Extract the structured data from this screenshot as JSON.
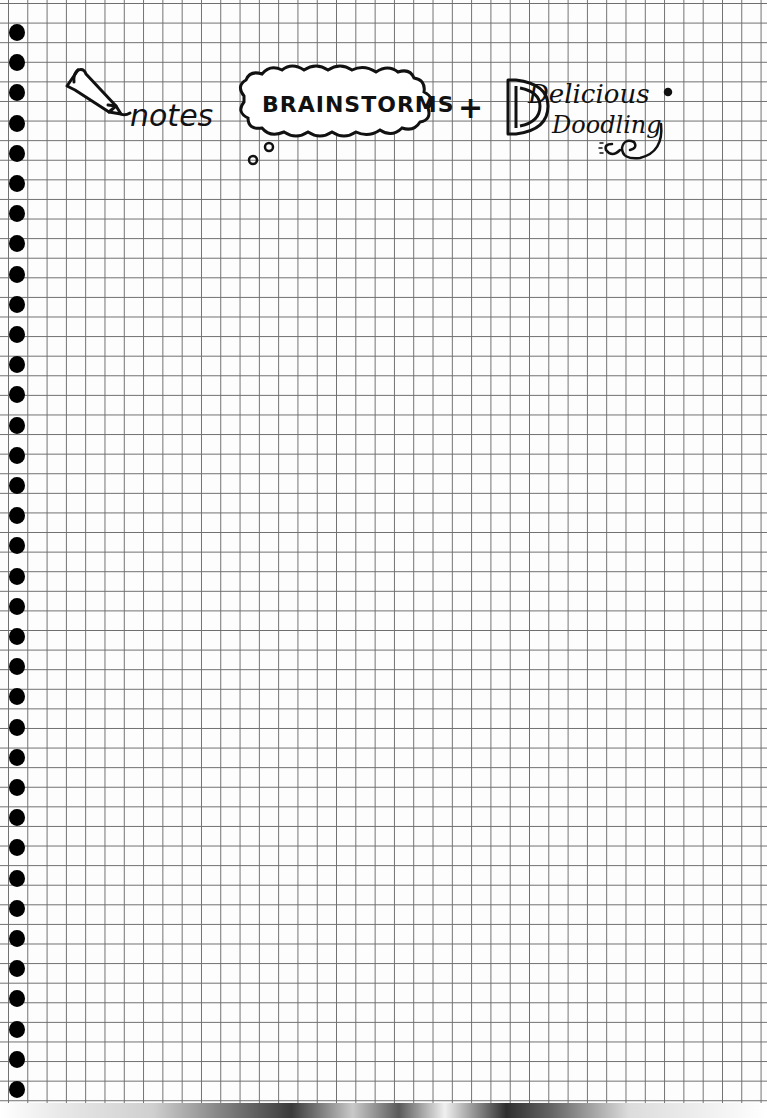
{
  "page": {
    "type": "graph-paper-notebook-page",
    "grid_color": "#6e6e6e",
    "paper_color": "#fdfdfd",
    "ink_color": "#111111",
    "hole_count": 36
  },
  "header": {
    "notes_label": "notes",
    "brainstorms_label": "BRAINSTORMS",
    "plus_symbol": "+",
    "delicious_label": "Delicious",
    "doodling_label": "Doodling"
  }
}
